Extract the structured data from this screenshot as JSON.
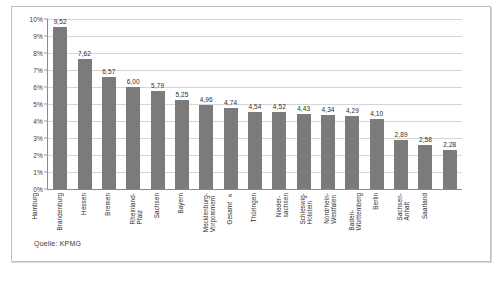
{
  "figure": {
    "source_note": "Quelle: KPMG",
    "bar_color": "#7b7b7b",
    "gridline_color": "#d5d5d5",
    "axis_color": "#8a8a8a",
    "border_color": "#bfbfbf"
  },
  "chart_data": {
    "type": "bar",
    "title": "",
    "subtitle": "",
    "xlabel": "",
    "ylabel": "",
    "ylim": [
      0,
      10
    ],
    "yunit": "%",
    "grid": true,
    "legend": "none",
    "decimal_separator": ",",
    "ytick_labels": [
      "10%",
      "9%",
      "8%",
      "7%",
      "6%",
      "5%",
      "4%",
      "3%",
      "2%",
      "1%",
      "0%"
    ],
    "ytick_values": [
      10,
      9,
      8,
      7,
      6,
      5,
      4,
      3,
      2,
      1,
      0
    ],
    "categories": [
      "Hamburg",
      "Brandenburg",
      "Hessen",
      "Bremen",
      "Rheinland-\nPfalz",
      "Sachsen",
      "Bayern",
      "Mecklenburg-\nVorpommern",
      "Gesamt ⌀",
      "Thüringen",
      "Nieder-\nsachsen",
      "Schleswig-\nHolstein",
      "Nordrhein-\nWestfalen",
      "Baden-\nWürttemberg",
      "Berlin",
      "Sachsen-\nAnhalt",
      "Saarland"
    ],
    "values": [
      9.52,
      7.62,
      6.57,
      6.0,
      5.79,
      5.25,
      4.96,
      4.74,
      4.54,
      4.52,
      4.43,
      4.34,
      4.29,
      4.1,
      2.89,
      2.58,
      2.28
    ],
    "value_labels": [
      "9,52",
      "7,62",
      "6,57",
      "6,00",
      "5,79",
      "5,25",
      "4,96",
      "4,74",
      "4,54",
      "4,52",
      "4,43",
      "4,34",
      "4,29",
      "4,10",
      "2,89",
      "2,58",
      "2,28"
    ]
  }
}
